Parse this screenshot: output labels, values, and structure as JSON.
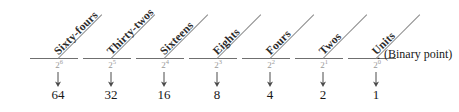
{
  "figure": {
    "background_color": "#ffffff",
    "line_color": "#6f6f6f",
    "power_color": "#9a9a9a",
    "text_color": "#171717"
  },
  "binary_point": {
    "dot": ".",
    "caption": "(Binary point)"
  },
  "columns": [
    {
      "name": "Sixty-fours",
      "power_base": "2",
      "power_exponent": "6",
      "value": "64",
      "x": 58
    },
    {
      "name": "Thirty-twos",
      "power_base": "2",
      "power_exponent": "5",
      "value": "32",
      "x": 111
    },
    {
      "name": "Sixteens",
      "power_base": "2",
      "power_exponent": "4",
      "value": "16",
      "x": 164
    },
    {
      "name": "Eights",
      "power_base": "2",
      "power_exponent": "3",
      "value": "8",
      "x": 217
    },
    {
      "name": "Fours",
      "power_base": "2",
      "power_exponent": "2",
      "value": "4",
      "x": 270
    },
    {
      "name": "Twos",
      "power_base": "2",
      "power_exponent": "1",
      "value": "2",
      "x": 323
    },
    {
      "name": "Units",
      "power_base": "2",
      "power_exponent": "0",
      "value": "1",
      "x": 376
    }
  ]
}
